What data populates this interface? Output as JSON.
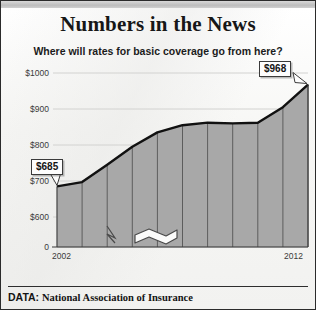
{
  "header": {
    "title": "Numbers in the News",
    "subtitle": "Where will rates for basic coverage go from here?"
  },
  "footer": {
    "label": "DATA:",
    "source": "National Association of Insurance"
  },
  "callouts": {
    "start": "$685",
    "end": "$968"
  },
  "colors": {
    "area_fill": "#a8a8a8",
    "line": "#111111",
    "background": "#fbfbfa",
    "border": "#2b2b2b",
    "grid": "#d2d2d0",
    "text": "#141414"
  },
  "chart_data": {
    "type": "area",
    "title": "Where will rates for basic coverage go from here?",
    "xlabel": "",
    "ylabel": "",
    "x": [
      2002,
      2003,
      2004,
      2005,
      2006,
      2007,
      2008,
      2009,
      2010,
      2011,
      2012
    ],
    "categories": [
      "2002",
      "2003",
      "2004",
      "2005",
      "2006",
      "2007",
      "2008",
      "2009",
      "2010",
      "2011",
      "2012"
    ],
    "values": [
      685,
      697,
      745,
      795,
      835,
      855,
      862,
      860,
      862,
      905,
      968
    ],
    "series": [
      {
        "name": "Average rate for basic coverage",
        "values": [
          685,
          697,
          745,
          795,
          835,
          855,
          862,
          860,
          862,
          905,
          968
        ]
      }
    ],
    "ylim": [
      560,
      1010
    ],
    "yticks": [
      0,
      600,
      700,
      800,
      900,
      1000
    ],
    "ytick_labels": [
      "0",
      "$600",
      "$700",
      "$800",
      "$900",
      "$1000"
    ],
    "xtick_labels_shown": [
      "2002",
      "2012"
    ],
    "grid": true,
    "legend": false,
    "axis_break": true,
    "annotations": [
      {
        "label": "$685",
        "x": 2002,
        "y": 685
      },
      {
        "label": "$968",
        "x": 2012,
        "y": 968
      }
    ]
  }
}
